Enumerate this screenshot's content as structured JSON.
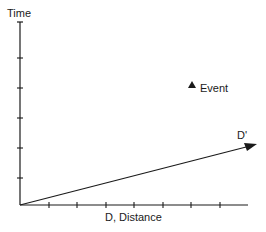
{
  "diagram": {
    "type": "spacetime-diagram",
    "y_axis": {
      "label": "Time",
      "end_label": "T"
    },
    "x_axis": {
      "label": "D, Distance"
    },
    "transformed_axis": {
      "label": "D'"
    },
    "event": {
      "label": "Event",
      "marker": "triangle"
    },
    "y_ticks": [
      58,
      88,
      118,
      148,
      178
    ],
    "x_ticks": [
      49,
      77,
      106,
      134,
      163,
      191,
      220
    ],
    "colors": {
      "line": "#1a1a1a",
      "background": "#ffffff"
    }
  }
}
